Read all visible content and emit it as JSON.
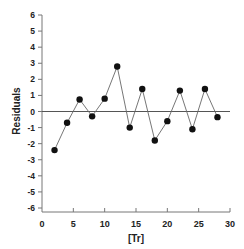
{
  "chart_data": {
    "type": "line",
    "title": "",
    "xlabel": "[Tr]",
    "ylabel": "Residuals",
    "xlim": [
      0,
      30
    ],
    "ylim": [
      -6,
      6
    ],
    "x_ticks": [
      0,
      5,
      10,
      15,
      20,
      25,
      30
    ],
    "y_ticks": [
      6,
      5,
      4,
      3,
      2,
      1,
      0,
      -1,
      -2,
      -3,
      -4,
      -5,
      -6
    ],
    "grid": false,
    "legend": null,
    "reference_line": {
      "y": 0
    },
    "series": [
      {
        "name": "Residuals",
        "x": [
          2,
          4,
          6,
          8,
          10,
          12,
          14,
          16,
          18,
          20,
          22,
          24,
          26,
          28
        ],
        "values": [
          -2.4,
          -0.7,
          0.75,
          -0.3,
          0.8,
          2.8,
          -1.0,
          1.4,
          -1.8,
          -0.6,
          1.3,
          -1.1,
          1.4,
          -0.35
        ],
        "marker": "filled-circle",
        "color": "#111111",
        "line_color": "#666666"
      }
    ]
  },
  "colors": {
    "axis": "#777777",
    "zero_line": "#555555",
    "marker": "#111111",
    "line": "#666666"
  }
}
